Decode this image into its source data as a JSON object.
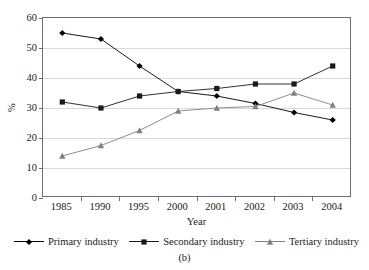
{
  "chart_data": {
    "type": "line",
    "title": "",
    "xlabel": "Year",
    "ylabel": "%",
    "categories": [
      "1985",
      "1990",
      "1995",
      "2000",
      "2001",
      "2002",
      "2003",
      "2004"
    ],
    "ylim": [
      0,
      60
    ],
    "yticks": [
      0,
      10,
      20,
      30,
      40,
      50,
      60
    ],
    "grid": true,
    "legend_position": "bottom",
    "series": [
      {
        "name": "Primary industry",
        "marker": "diamond",
        "color": "#000000",
        "values": [
          55,
          53,
          44,
          35.5,
          34,
          31.5,
          28.5,
          26
        ]
      },
      {
        "name": "Secondary industry",
        "marker": "square",
        "color": "#1a1a1a",
        "values": [
          32,
          30,
          34,
          35.5,
          36.5,
          38,
          38,
          44
        ]
      },
      {
        "name": "Tertiary industry",
        "marker": "triangle",
        "color": "#808080",
        "values": [
          14,
          17.5,
          22.5,
          29,
          30,
          30.5,
          35,
          31
        ]
      }
    ]
  },
  "figure": {
    "caption": "(b)",
    "clipped_title": ""
  }
}
